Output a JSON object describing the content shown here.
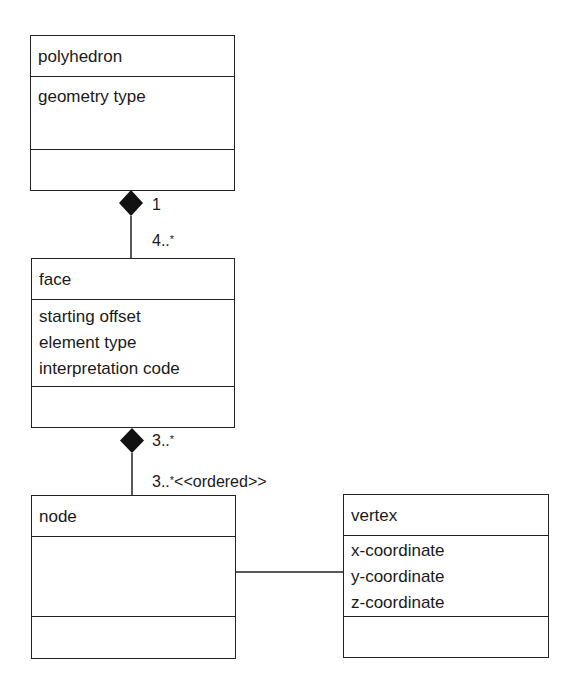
{
  "classes": {
    "polyhedron": {
      "name": "polyhedron",
      "attributes": [
        "geometry type"
      ],
      "operations": []
    },
    "face": {
      "name": "face",
      "attributes": [
        "starting offset",
        "element type",
        "interpretation code"
      ],
      "operations": []
    },
    "node": {
      "name": "node",
      "attributes": [],
      "operations": []
    },
    "vertex": {
      "name": "vertex",
      "attributes": [
        "x-coordinate",
        "y-coordinate",
        "z-coordinate"
      ],
      "operations": []
    }
  },
  "associations": {
    "polyhedron_face": {
      "type": "composition",
      "whole_multiplicity": "1",
      "part_multiplicity_num": "4..",
      "part_multiplicity_star": "*"
    },
    "face_node": {
      "type": "composition",
      "whole_multiplicity_num": "3..",
      "whole_multiplicity_star": "*",
      "part_multiplicity_num": "3..",
      "part_multiplicity_star": "*",
      "part_constraint": "<<ordered>>"
    },
    "node_vertex": {
      "type": "association"
    }
  },
  "colors": {
    "line": "#222222",
    "background": "#ffffff"
  }
}
